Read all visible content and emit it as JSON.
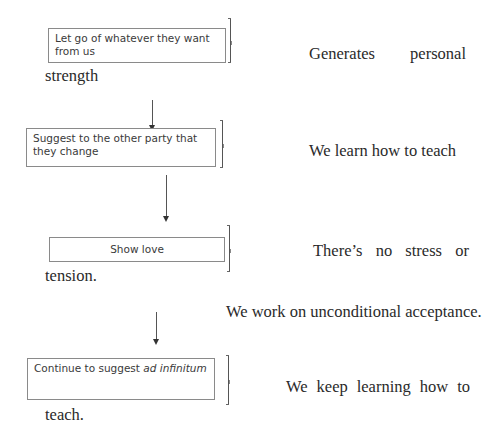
{
  "steps": [
    {
      "box_text": "Let go of whatever they want from us",
      "outcome_line1_words": [
        "Generates",
        "personal"
      ],
      "outcome_line2": "strength"
    },
    {
      "box_text": "Suggest to the other party that they change",
      "outcome_line1": "We learn how to teach"
    },
    {
      "box_text": "Show love",
      "outcome_line1_words": [
        "There’s",
        "no",
        "stress",
        "or"
      ],
      "outcome_line2": "tension.",
      "outcome_extra": "We work on unconditional acceptance."
    },
    {
      "box_text_plain": "Continue to suggest ",
      "box_text_italic": "ad infinitum",
      "outcome_line1_words": [
        "We",
        "keep",
        "learning",
        "how",
        "to"
      ],
      "outcome_line2": "teach."
    }
  ],
  "arrows": [
    {
      "from": "step-1",
      "to": "step-2"
    },
    {
      "from": "step-2",
      "to": "step-3"
    },
    {
      "from": "step-3",
      "to": "step-4"
    }
  ],
  "colors": {
    "box_border": "#8a8a8a",
    "box_text": "#3a3a3a",
    "serif_text": "#2a2a2a",
    "arrow": "#555555"
  }
}
